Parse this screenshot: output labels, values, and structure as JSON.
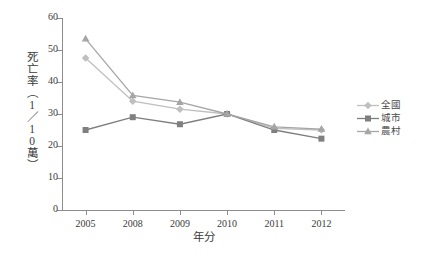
{
  "chart_data": {
    "type": "line",
    "title": "",
    "xlabel": "年分",
    "ylabel": "死亡率（1／10萬）",
    "categories": [
      "2005",
      "2008",
      "2009",
      "2010",
      "2011",
      "2012"
    ],
    "ylim": [
      0,
      60
    ],
    "yticks": [
      0,
      10,
      20,
      30,
      40,
      50,
      60
    ],
    "grid": false,
    "legend_position": "right",
    "series": [
      {
        "name": "全國",
        "marker": "diamond",
        "color": "#bfbfbf",
        "values": [
          47.5,
          34.0,
          31.5,
          30.0,
          25.5,
          25.0
        ]
      },
      {
        "name": "城市",
        "marker": "square",
        "color": "#7f7f7f",
        "values": [
          25.0,
          29.0,
          26.8,
          30.0,
          25.0,
          22.3
        ]
      },
      {
        "name": "農村",
        "marker": "triangle",
        "color": "#a6a6a6",
        "values": [
          53.5,
          35.8,
          33.7,
          30.0,
          26.0,
          25.3
        ]
      }
    ]
  },
  "axis": {
    "ytick_labels": [
      "0",
      "10",
      "20",
      "30",
      "40",
      "50",
      "60"
    ],
    "xtick_labels": [
      "2005",
      "2008",
      "2009",
      "2010",
      "2011",
      "2012"
    ],
    "x_title": "年分",
    "y_title": "死亡率（1／10萬）"
  },
  "legend": {
    "items": [
      {
        "label": "全國"
      },
      {
        "label": "城市"
      },
      {
        "label": "農村"
      }
    ]
  },
  "colors": {
    "axis": "#8d8d8d",
    "text": "#3b3b3b",
    "series_national": "#bfbfbf",
    "series_city": "#7f7f7f",
    "series_rural": "#a6a6a6"
  }
}
